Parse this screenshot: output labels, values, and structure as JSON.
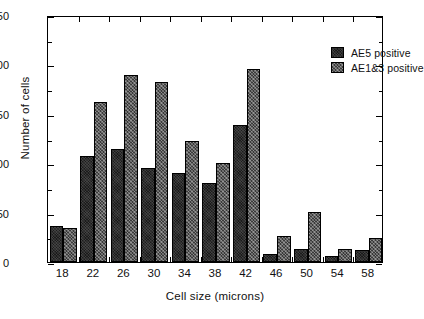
{
  "chart_data": {
    "type": "bar",
    "title": "",
    "xlabel": "Cell size (microns)",
    "ylabel": "Number of cells",
    "categories": [
      "18",
      "22",
      "26",
      "30",
      "34",
      "38",
      "42",
      "46",
      "50",
      "54",
      "58"
    ],
    "series": [
      {
        "name": "AE5 positive",
        "values": [
          36,
          107,
          114,
          95,
          90,
          80,
          139,
          8,
          13,
          6,
          12
        ]
      },
      {
        "name": "AE1&3 positive",
        "values": [
          34,
          162,
          189,
          182,
          122,
          100,
          195,
          26,
          51,
          13,
          24
        ]
      }
    ],
    "ylim": [
      0,
      250
    ],
    "yticks": [
      0,
      50,
      100,
      150,
      200,
      250
    ],
    "ytick_labels": [
      "0",
      "50",
      "100",
      "150",
      "200",
      "250"
    ],
    "yminor_ticks": [
      25,
      75,
      125,
      175,
      225
    ],
    "grid": false,
    "legend_position": "top-right",
    "legend_entries": [
      "AE5 positive",
      "AE1&3 positive"
    ],
    "colors": {
      "series_a": "#1b1b1b",
      "series_b": "#3a3a3a",
      "axis": "#000000",
      "background": "#ffffff",
      "text": "#111111"
    }
  }
}
